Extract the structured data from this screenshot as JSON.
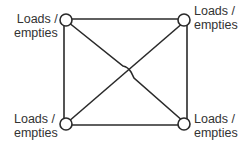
{
  "diagram": {
    "type": "network",
    "colors": {
      "line": "#2a2a2a",
      "node_fill": "#ffffff",
      "text": "#333333"
    },
    "nodes": [
      {
        "id": "top-left",
        "line1": "Loads /",
        "line2": "empties"
      },
      {
        "id": "top-right",
        "line1": "Loads /",
        "line2": "empties"
      },
      {
        "id": "bottom-left",
        "line1": "Loads /",
        "line2": "empties"
      },
      {
        "id": "bottom-right",
        "line1": "Loads /",
        "line2": "empties"
      }
    ],
    "edges": [
      [
        "top-left",
        "top-right"
      ],
      [
        "top-left",
        "bottom-left"
      ],
      [
        "top-right",
        "bottom-right"
      ],
      [
        "bottom-left",
        "bottom-right"
      ],
      [
        "top-left",
        "bottom-right"
      ],
      [
        "bottom-left",
        "top-right"
      ]
    ]
  }
}
